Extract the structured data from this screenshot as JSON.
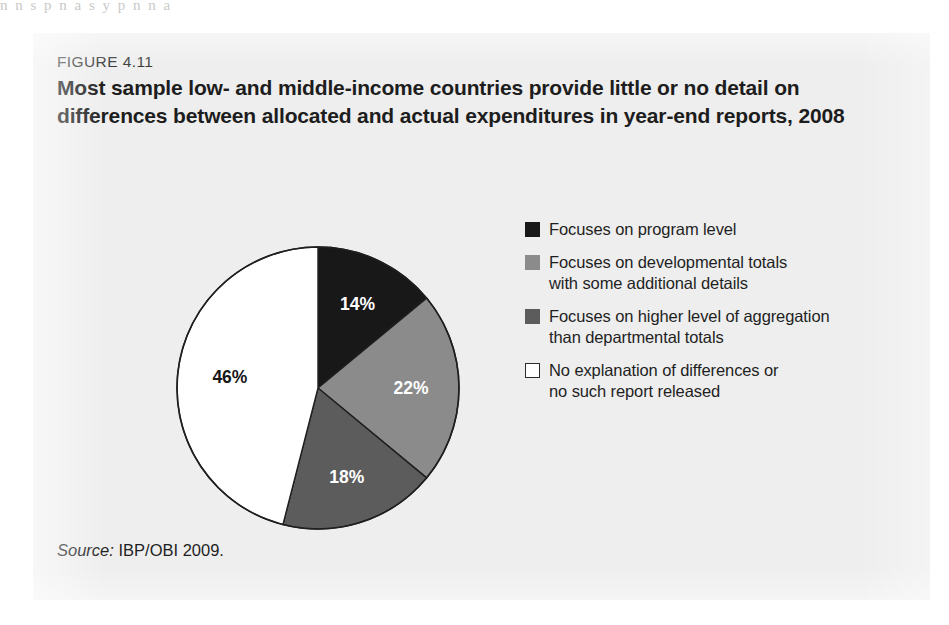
{
  "page": {
    "bleed_text": "n n s p n a s y p n n a"
  },
  "figure": {
    "number": "FIGURE 4.11",
    "title": "Most sample low- and middle-income countries provide little or no detail on differences between allocated and actual expenditures in year-end reports, 2008",
    "source_label": "Source:",
    "source_text": "IBP/OBI 2009."
  },
  "chart_data": {
    "type": "pie",
    "title": "Most sample low- and middle-income countries provide little or no detail on differences between allocated and actual expenditures in year-end reports, 2008",
    "unit": "percent",
    "start_angle_deg": 0,
    "direction": "clockwise",
    "total": 100,
    "categories": [
      "Focuses on program level",
      "Focuses on developmental totals with some additional details",
      "Focuses on higher level of aggregation than departmental totals",
      "No explanation of differences or no such report released"
    ],
    "values": [
      14,
      22,
      18,
      46
    ],
    "data_labels": [
      "14%",
      "22%",
      "18%",
      "46%"
    ],
    "colors": [
      "#181818",
      "#8b8b8b",
      "#5c5c5c",
      "#ffffff"
    ],
    "label_text_colors": [
      "#ffffff",
      "#ffffff",
      "#ffffff",
      "#171717"
    ],
    "legend_position": "right",
    "grid": false,
    "slices": [
      {
        "label": "Focuses on program level",
        "value": 14,
        "data_label": "14%",
        "color": "#181818",
        "label_color": "#ffffff"
      },
      {
        "label": "Focuses on developmental totals with some additional details",
        "value": 22,
        "data_label": "22%",
        "color": "#8b8b8b",
        "label_color": "#ffffff"
      },
      {
        "label": "Focuses on higher level of aggregation than departmental totals",
        "value": 18,
        "data_label": "18%",
        "color": "#5c5c5c",
        "label_color": "#ffffff"
      },
      {
        "label": "No explanation of differences or no such report released",
        "value": 46,
        "data_label": "46%",
        "color": "#ffffff",
        "label_color": "#171717"
      }
    ]
  },
  "legend": {
    "items": [
      {
        "swatch": "#181818",
        "line1": "Focuses on program level",
        "line2": ""
      },
      {
        "swatch": "#8b8b8b",
        "line1": "Focuses on developmental totals",
        "line2": "with some additional details"
      },
      {
        "swatch": "#5c5c5c",
        "line1": "Focuses on higher level of aggregation",
        "line2": "than departmental totals"
      },
      {
        "swatch": "#ffffff",
        "line1": "No explanation of differences or",
        "line2": "no such report released"
      }
    ]
  }
}
